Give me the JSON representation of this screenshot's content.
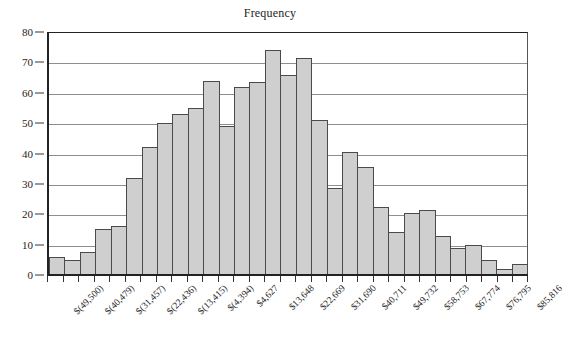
{
  "chart_data": {
    "type": "bar",
    "title": "Frequency",
    "xlabel": "",
    "ylabel": "",
    "ylim": [
      0,
      80
    ],
    "ytick_step": 10,
    "yticks": [
      0,
      10,
      20,
      30,
      40,
      50,
      60,
      70,
      80
    ],
    "grid": true,
    "legend": null,
    "legend_position": "none",
    "bar_fill_color": "#cfcfcf",
    "bar_edge_color": "#4a4a4a",
    "axis_color": "#222222",
    "gridline_color": "#8e8e8e",
    "bin_labels_every": 3,
    "categories": [
      "$(49,500)",
      "",
      "",
      "$(40,479)",
      "",
      "",
      "$(31,457)",
      "",
      "",
      "$(22,436)",
      "",
      "",
      "$(13,415)",
      "",
      "",
      "$(4,394)",
      "",
      "",
      "$4,627",
      "",
      "",
      "$13,648",
      "",
      "",
      "$22,669",
      "",
      "",
      "$31,690",
      "",
      "",
      "$40,711"
    ],
    "tick_labels": [
      "$(49,500)",
      "$(40,479)",
      "$(31,457)",
      "$(22,436)",
      "$(13,415)",
      "$(4,394)",
      "$4,627",
      "$13,648",
      "$22,669",
      "$31,690",
      "$40,711",
      "$49,732",
      "$58,753",
      "$67,774",
      "$76,795",
      "$85,816"
    ],
    "values": [
      6,
      5,
      7.5,
      15,
      16,
      32,
      42,
      50,
      53,
      55,
      64,
      49,
      62,
      63.5,
      74,
      66,
      71.5,
      51,
      28.5,
      40.5,
      35.5,
      22.5,
      14,
      20.5,
      21.5,
      13,
      9,
      10,
      5,
      2,
      3.5
    ]
  }
}
